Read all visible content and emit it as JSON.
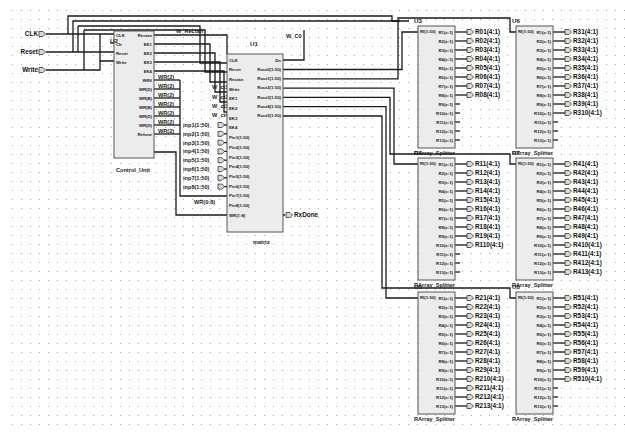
{
  "schematic": {
    "grid": {
      "spacing": 9,
      "dot_color": "#9a9a9a"
    },
    "inputs": [
      {
        "label": "CLK",
        "y": 34
      },
      {
        "label": "Reset",
        "y": 52
      },
      {
        "label": "Write",
        "y": 70
      }
    ],
    "control_unit": {
      "instance": "U2",
      "name": "Control_Unit",
      "left_pins": [
        "CLK",
        "Ch",
        "Reset",
        "Write"
      ],
      "right_pins": [
        "Rectan",
        "EK1",
        "EK2",
        "EK3",
        "EK4",
        "WR0",
        "WR(D)",
        "WR(B)",
        "WR(B)",
        "WR(D)",
        "WR(D)",
        "Refone"
      ]
    },
    "wr_labels": [
      "WR(2)",
      "WR(2)",
      "WR(2)",
      "WR(2)",
      "WR(2)",
      "WR(2)",
      "WR(2)"
    ],
    "wire_labels": {
      "w_rectan": "W_Rectan",
      "w_c0": "W_C0",
      "w_ct1": "W_ct1",
      "w_ct2": "W_ct2",
      "w_ct3": "W_ct3",
      "w_ct4": "W_ct4",
      "wr_bus": "WR(0:8)"
    },
    "matrix": {
      "instance": "U1",
      "name": "matrix",
      "left_pins": [
        "CLK",
        "Reset",
        "Rectan",
        "Write",
        "EK1",
        "EK2",
        "EK3",
        "EK4",
        "Pin1(1:50)",
        "Pin2(1:50)",
        "Pin3(1:50)",
        "Pin4(1:50)",
        "Pin5(1:50)",
        "Pin6(1:50)",
        "Pin7(1:50)",
        "Pin8(1:50)",
        "WR(1:8)"
      ],
      "right_pins": [
        "Dn",
        "Rout0(1:50)",
        "Rout1(1:50)",
        "Rout2(1:50)",
        "Rout3(1:50)",
        "Rout4(1:50)",
        "Rout5(1:50)"
      ]
    },
    "inp_ports": [
      "inp1(1:50)",
      "inp2(1:50)",
      "inp3(1:50)",
      "inp4(1:50)",
      "inp5(1:50)",
      "inp6(1:50)",
      "inp7(1:50)",
      "inp8(1:50)"
    ],
    "output_port": "RxDone",
    "splitters": [
      {
        "instance": "U3",
        "name": "RArray_Splitter",
        "input": "RI(1:50)",
        "outputs": [
          "R01(4:1)",
          "R02(4:1)",
          "R03(4:1)",
          "R04(4:1)",
          "R05(4:1)",
          "R06(4:1)",
          "R07(4:1)",
          "R08(4:1)"
        ]
      },
      {
        "instance": "U6",
        "name": "RArray_Splitter",
        "input": "RI(1:50)",
        "outputs": [
          "R31(4:1)",
          "R32(4:1)",
          "R33(4:1)",
          "R34(4:1)",
          "R35(4:1)",
          "R36(4:1)",
          "R37(4:1)",
          "R38(4:1)",
          "R39(4:1)",
          "R310(4:1)"
        ]
      },
      {
        "instance": "U4",
        "name": "RArray_Splitter",
        "input": "RI(1:50)",
        "outputs": [
          "R11(4:1)",
          "R12(4:1)",
          "R13(4:1)",
          "R14(4:1)",
          "R15(4:1)",
          "R16(4:1)",
          "R17(4:1)",
          "R18(4:1)",
          "R19(4:1)",
          "R110(4:1)"
        ]
      },
      {
        "instance": "U7",
        "name": "RArray_Splitter",
        "input": "RI(1:50)",
        "outputs": [
          "R41(4:1)",
          "R42(4:1)",
          "R43(4:1)",
          "R44(4:1)",
          "R45(4:1)",
          "R46(4:1)",
          "R47(4:1)",
          "R48(4:1)",
          "R49(4:1)",
          "R410(4:1)",
          "R411(4:1)",
          "R412(4:1)",
          "R413(4:1)"
        ]
      },
      {
        "instance": "U5",
        "name": "RArray_Splitter",
        "input": "RI(1:50)",
        "outputs": [
          "R21(4:1)",
          "R22(4:1)",
          "R23(4:1)",
          "R24(4:1)",
          "R25(4:1)",
          "R26(4:1)",
          "R27(4:1)",
          "R28(4:1)",
          "R29(4:1)",
          "R210(4:1)",
          "R211(4:1)",
          "R212(4:1)",
          "R213(4:1)"
        ]
      },
      {
        "instance": "U8",
        "name": "RArray_Splitter",
        "input": "RI(1:50)",
        "outputs": [
          "R51(4:1)",
          "R52(4:1)",
          "R53(4:1)",
          "R54(4:1)",
          "R55(4:1)",
          "R56(4:1)",
          "R57(4:1)",
          "R58(4:1)",
          "R59(4:1)",
          "R510(4:1)"
        ]
      }
    ],
    "splitter_pins": [
      "R1(x:1)",
      "R2(x:1)",
      "R3(x:1)",
      "R4(x:1)",
      "R5(x:1)",
      "R6(x:1)",
      "R7(x:1)",
      "R8(x:1)",
      "R9(x:1)",
      "R10(x:1)",
      "R11(x:1)",
      "R12(x:1)",
      "R13(x:1)"
    ]
  }
}
